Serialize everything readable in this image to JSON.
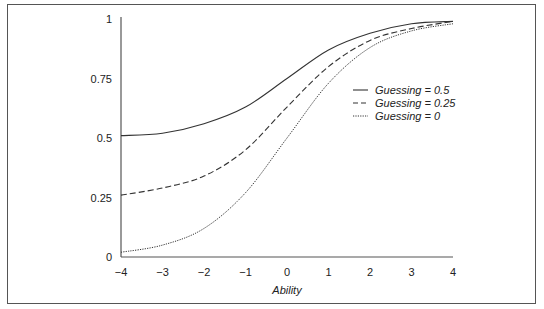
{
  "chart_data": {
    "type": "line",
    "title": "",
    "xlabel": "Ability",
    "ylabel": "",
    "xlim": [
      -4,
      4
    ],
    "ylim": [
      0,
      1
    ],
    "grid": false,
    "legend_position": "right-center",
    "x": [
      -4,
      -3,
      -2,
      -1,
      0,
      1,
      2,
      3,
      4
    ],
    "x_tick_labels": [
      "−4",
      "−3",
      "−2",
      "−1",
      "0",
      "1",
      "2",
      "3",
      "4"
    ],
    "y_ticks": [
      0,
      0.25,
      0.5,
      0.75,
      1
    ],
    "y_tick_labels": [
      "0",
      "0.25",
      "0.5",
      "0.75",
      "1"
    ],
    "series": [
      {
        "name": "Guessing = 0.5",
        "style": "solid",
        "values": [
          0.51,
          0.52,
          0.56,
          0.63,
          0.75,
          0.87,
          0.94,
          0.98,
          0.99
        ]
      },
      {
        "name": "Guessing = 0.25",
        "style": "dashed",
        "values": [
          0.26,
          0.29,
          0.34,
          0.45,
          0.63,
          0.8,
          0.91,
          0.96,
          0.99
        ]
      },
      {
        "name": "Guessing = 0",
        "style": "dotted",
        "values": [
          0.02,
          0.05,
          0.12,
          0.27,
          0.5,
          0.73,
          0.88,
          0.95,
          0.98
        ]
      }
    ]
  },
  "colors": {
    "line": "#333333",
    "axis": "#555555",
    "frame": "#555555"
  }
}
